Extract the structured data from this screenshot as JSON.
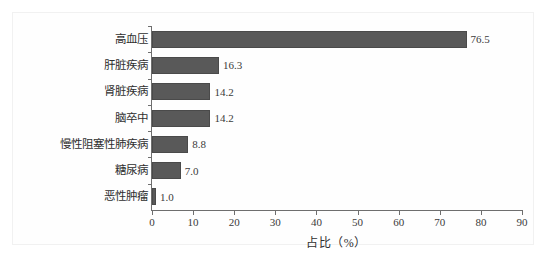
{
  "chart_data": {
    "type": "bar",
    "orientation": "horizontal",
    "title": "",
    "xlabel": "占比（%）",
    "ylabel": "",
    "xlim": [
      0,
      90
    ],
    "xticks": [
      0,
      10,
      20,
      30,
      40,
      50,
      60,
      70,
      80,
      90
    ],
    "grid": false,
    "legend": null,
    "bar_color": "#595959",
    "categories": [
      "高血压",
      "肝脏疾病",
      "肾脏疾病",
      "脑卒中",
      "慢性阻塞性肺疾病",
      "糖尿病",
      "恶性肿瘤"
    ],
    "values": [
      76.5,
      16.3,
      14.2,
      14.2,
      8.8,
      7.0,
      1.0
    ],
    "value_labels": [
      "76.5",
      "16.3",
      "14.2",
      "14.2",
      "8.8",
      "7.0",
      "1.0"
    ]
  },
  "caption": ""
}
